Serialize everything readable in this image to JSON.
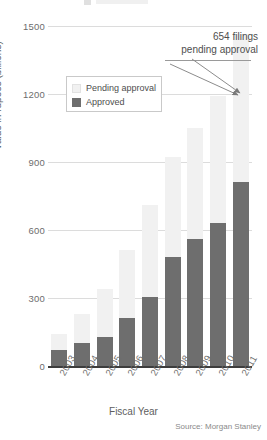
{
  "chart_data": {
    "type": "bar",
    "subtype": "stacked",
    "title": "",
    "xlabel": "Fiscal Year",
    "ylabel": "Value in rupees (billions)",
    "categories": [
      "2003",
      "2004",
      "2005",
      "2006",
      "2007",
      "2008",
      "2009",
      "2010",
      "2011"
    ],
    "series": [
      {
        "name": "Approved",
        "color": "#6e6e6e",
        "values": [
          70,
          100,
          130,
          210,
          305,
          480,
          560,
          630,
          810
        ]
      },
      {
        "name": "Pending approval",
        "color": "#f1f1f1",
        "values": [
          70,
          130,
          210,
          300,
          405,
          440,
          490,
          560,
          654
        ]
      }
    ],
    "totals": [
      140,
      230,
      340,
      510,
      710,
      920,
      1050,
      1190,
      1470
    ],
    "ylim": [
      0,
      1500
    ],
    "yticks": [
      0,
      300,
      600,
      900,
      1200,
      1500
    ],
    "ytick_labels": [
      "0",
      "300",
      "600",
      "900",
      "1200",
      "1500"
    ],
    "grid": true,
    "legend_position": "upper-left-inside",
    "annotations": [
      {
        "text_line1": "654 filings",
        "text_line2": "pending approval",
        "target_category": "2011",
        "target_series": "Pending approval"
      }
    ],
    "source": "Source: Morgan Stanley"
  },
  "legend": {
    "items": [
      {
        "label": "Pending approval",
        "color": "#f1f1f1"
      },
      {
        "label": "Approved",
        "color": "#6e6e6e"
      }
    ]
  },
  "annotation": {
    "line1": "654 filings",
    "line2": "pending approval"
  },
  "axes": {
    "x_title": "Fiscal Year",
    "y_title": "Value in rupees (billions)"
  },
  "footer": {
    "source": "Source: Morgan Stanley"
  }
}
